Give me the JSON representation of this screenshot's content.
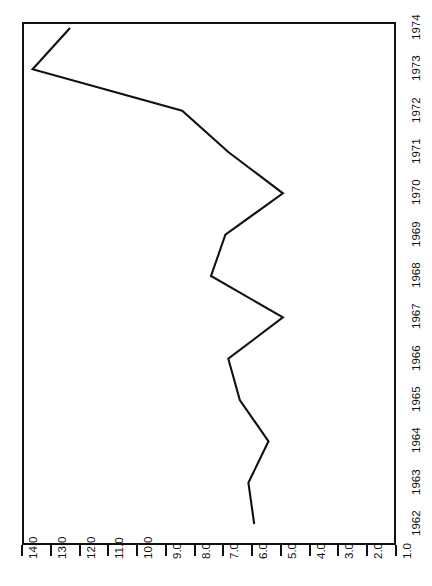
{
  "chart_data": {
    "type": "line",
    "title": "",
    "subtitle": "",
    "xlabel": "",
    "ylabel": "",
    "orientation": "rotated-90",
    "grid": false,
    "legend": null,
    "x": [
      1962,
      1963,
      1964,
      1965,
      1966,
      1967,
      1968,
      1969,
      1970,
      1971,
      1972,
      1973,
      1974
    ],
    "categories": [
      "1962",
      "1963",
      "1964",
      "1965",
      "1966",
      "1967",
      "1968",
      "1969",
      "1970",
      "1971",
      "1972",
      "1973",
      "1974"
    ],
    "values": [
      6.0,
      6.2,
      5.5,
      6.5,
      6.9,
      5.0,
      7.5,
      7.0,
      5.0,
      6.9,
      8.5,
      13.7,
      12.4
    ],
    "xlim": [
      1962,
      1974
    ],
    "ylim": [
      1.0,
      14.0
    ],
    "x_tick_labels": [
      "1962",
      "1963",
      "1964",
      "1965",
      "1966",
      "1967",
      "1968",
      "1969",
      "1970",
      "1971",
      "1972",
      "1973",
      "1974"
    ],
    "y_tick_labels": [
      "14.0",
      "13.0",
      "12.0",
      "11.0",
      "10.0",
      "9.0",
      "8.0",
      "7.0",
      "6.0",
      "5.0",
      "4.0",
      "3.0",
      "2.0",
      "1.0"
    ],
    "y_tick_values": [
      14.0,
      13.0,
      12.0,
      11.0,
      10.0,
      9.0,
      8.0,
      7.0,
      6.0,
      5.0,
      4.0,
      3.0,
      2.0,
      1.0
    ],
    "line_color": "#111111",
    "background_color": "#ffffff",
    "axis_color": "#111111",
    "markers": false
  }
}
